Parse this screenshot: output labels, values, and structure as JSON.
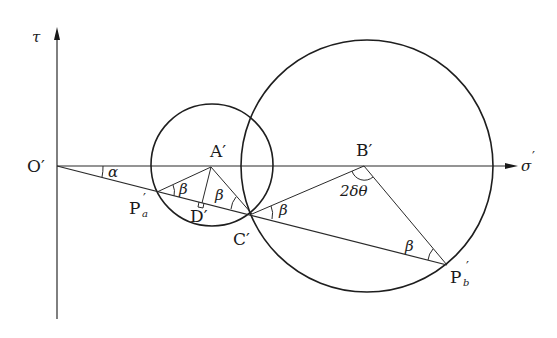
{
  "diagram": {
    "type": "mohr-circle-construction",
    "axes": {
      "vertical_label": "τ",
      "horizontal_label": "σ",
      "horizontal_label_prime": "′",
      "origin_label": "O′"
    },
    "points": {
      "A": "A′",
      "B": "B′",
      "C": "C′",
      "D": "D′",
      "Pa_main": "P",
      "Pa_sub": "a",
      "Pb_main": "P",
      "Pb_sub": "b",
      "prime": "′"
    },
    "angles": {
      "alpha": "α",
      "beta": "β",
      "two_delta_theta": "2δθ"
    },
    "colors": {
      "stroke": "#1e1e1e",
      "background": "#ffffff"
    }
  }
}
